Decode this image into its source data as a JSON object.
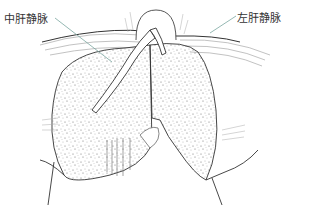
{
  "diagram": {
    "labels": {
      "middle_hepatic_vein": "中肝静脉",
      "left_hepatic_vein": "左肝静脉"
    },
    "colors": {
      "line": "#444444",
      "leader": "#7aa6a0",
      "label": "#333333",
      "background": "#ffffff"
    }
  }
}
